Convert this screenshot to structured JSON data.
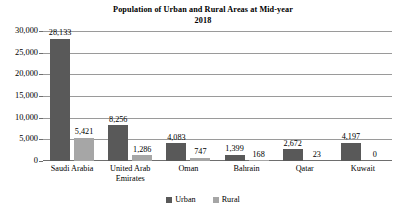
{
  "chart_data": {
    "type": "bar",
    "title": "Population of Urban and Rural Areas at Mid-year 2018",
    "title_line1": "Population of Urban and Rural Areas at Mid-year",
    "title_line2": "2018",
    "xlabel": "",
    "ylabel": "",
    "ylim": [
      0,
      30000
    ],
    "grid": true,
    "legend_position": "bottom",
    "categories": [
      "Saudi Arabia",
      "United Arab Emirates",
      "Oman",
      "Bahrain",
      "Qatar",
      "Kuwait"
    ],
    "category_lines": [
      [
        "Saudi Arabia"
      ],
      [
        "United Arab",
        "Emirates"
      ],
      [
        "Oman"
      ],
      [
        "Bahrain"
      ],
      [
        "Qatar"
      ],
      [
        "Kuwait"
      ]
    ],
    "ytick_labels": [
      "30,000",
      "25,000",
      "20,000",
      "15,000",
      "10,000",
      "5,000",
      "0"
    ],
    "ytick_values": [
      30000,
      25000,
      20000,
      15000,
      10000,
      5000,
      0
    ],
    "series": [
      {
        "name": "Urban",
        "color": "#595959",
        "values": [
          28133,
          8256,
          4083,
          1399,
          2672,
          4197
        ],
        "labels": [
          "28,133",
          "8,256",
          "4,083",
          "1,399",
          "2,672",
          "4,197"
        ]
      },
      {
        "name": "Rural",
        "color": "#a6a6a6",
        "values": [
          5421,
          1286,
          747,
          168,
          23,
          0
        ],
        "labels": [
          "5,421",
          "1,286",
          "747",
          "168",
          "23",
          "0"
        ]
      }
    ]
  },
  "legend": {
    "items": [
      {
        "label": "Urban",
        "color": "#595959"
      },
      {
        "label": "Rural",
        "color": "#a6a6a6"
      }
    ]
  }
}
